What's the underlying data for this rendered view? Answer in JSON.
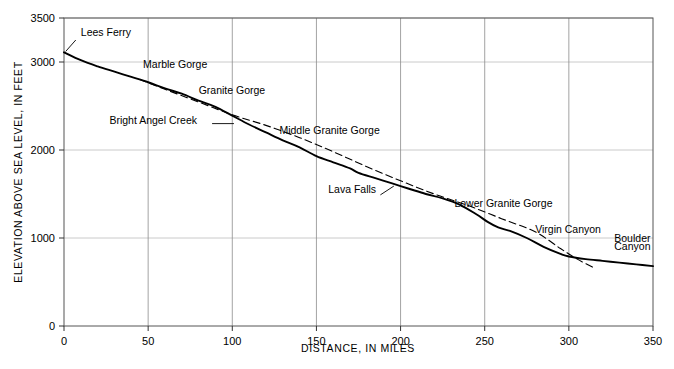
{
  "chart_data": {
    "type": "line",
    "title": "",
    "xlabel": "DISTANCE, IN  MILES",
    "ylabel": "ELEVATION  ABOVE  SEA  LEVEL,  IN  FEET",
    "xlim": [
      0,
      350
    ],
    "ylim": [
      0,
      3500
    ],
    "xticks": [
      0,
      50,
      100,
      150,
      200,
      250,
      300,
      350
    ],
    "xtick_labels": [
      "0",
      "50",
      "100",
      "150",
      "200",
      "250",
      "300",
      "350"
    ],
    "yticks": [
      0,
      1000,
      2000,
      3000,
      3500
    ],
    "ytick_labels": [
      "0",
      "1000",
      "2000",
      "3000",
      "3500"
    ],
    "grid": "both",
    "legend": "none",
    "series": [
      {
        "name": "river profile",
        "style": "solid",
        "color": "#000000",
        "points": [
          [
            0,
            3110
          ],
          [
            10,
            3020
          ],
          [
            20,
            2950
          ],
          [
            30,
            2890
          ],
          [
            40,
            2830
          ],
          [
            50,
            2770
          ],
          [
            60,
            2700
          ],
          [
            70,
            2640
          ],
          [
            80,
            2560
          ],
          [
            90,
            2490
          ],
          [
            100,
            2390
          ],
          [
            110,
            2290
          ],
          [
            120,
            2200
          ],
          [
            130,
            2110
          ],
          [
            140,
            2030
          ],
          [
            150,
            1930
          ],
          [
            160,
            1860
          ],
          [
            170,
            1790
          ],
          [
            175,
            1740
          ],
          [
            185,
            1680
          ],
          [
            195,
            1620
          ],
          [
            205,
            1560
          ],
          [
            215,
            1500
          ],
          [
            225,
            1450
          ],
          [
            235,
            1380
          ],
          [
            245,
            1270
          ],
          [
            252,
            1180
          ],
          [
            258,
            1120
          ],
          [
            265,
            1080
          ],
          [
            275,
            1000
          ],
          [
            285,
            900
          ],
          [
            295,
            820
          ],
          [
            300,
            790
          ],
          [
            310,
            760
          ],
          [
            320,
            740
          ],
          [
            330,
            720
          ],
          [
            340,
            700
          ],
          [
            350,
            680
          ]
        ]
      },
      {
        "name": "smoothed gradient",
        "style": "dashed",
        "color": "#000000",
        "points": [
          [
            45,
            2800
          ],
          [
            60,
            2690
          ],
          [
            80,
            2545
          ],
          [
            100,
            2400
          ],
          [
            120,
            2280
          ],
          [
            140,
            2140
          ],
          [
            160,
            1980
          ],
          [
            180,
            1810
          ],
          [
            200,
            1650
          ],
          [
            220,
            1500
          ],
          [
            240,
            1370
          ],
          [
            260,
            1220
          ],
          [
            280,
            1070
          ],
          [
            295,
            880
          ],
          [
            305,
            760
          ],
          [
            315,
            660
          ]
        ]
      }
    ],
    "annotations": [
      {
        "name": "lees-ferry",
        "text": "Lees Ferry",
        "x": 10,
        "y": 3300,
        "leader": {
          "x1": 7,
          "y1": 3250,
          "x2": 1,
          "y2": 3120
        }
      },
      {
        "name": "marble-gorge",
        "text": "Marble Gorge",
        "x": 47,
        "y": 2930,
        "leader": null
      },
      {
        "name": "granite-gorge",
        "text": "Granite Gorge",
        "x": 80,
        "y": 2640,
        "leader": null
      },
      {
        "name": "bright-angel-creek",
        "text": "Bright Angel Creek",
        "x": 27,
        "y": 2300,
        "leader": {
          "x1": 88,
          "y1": 2300,
          "x2": 101,
          "y2": 2300
        }
      },
      {
        "name": "middle-granite-gorge",
        "text": "Middle Granite Gorge",
        "x": 128,
        "y": 2180,
        "leader": null
      },
      {
        "name": "lava-falls",
        "text": "Lava Falls",
        "x": 157,
        "y": 1510,
        "leader": {
          "x1": 188,
          "y1": 1490,
          "x2": 196,
          "y2": 1590
        }
      },
      {
        "name": "lower-granite-gorge",
        "text": "Lower Granite Gorge",
        "x": 232,
        "y": 1350,
        "leader": null
      },
      {
        "name": "virgin-canyon",
        "text": "Virgin Canyon",
        "x": 280,
        "y": 1060,
        "leader": null
      },
      {
        "name": "boulder-canyon-line1",
        "text": "Boulder",
        "x": 327,
        "y": 960,
        "leader": null
      },
      {
        "name": "boulder-canyon-line2",
        "text": "Canyon",
        "x": 327,
        "y": 860,
        "leader": null
      }
    ]
  }
}
